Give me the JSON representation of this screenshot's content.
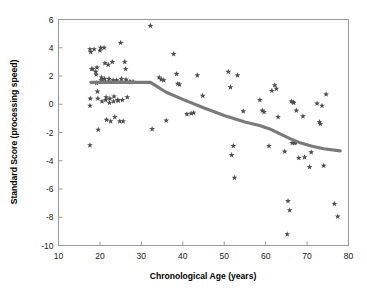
{
  "chart_data": {
    "type": "scatter",
    "title": "",
    "xlabel": "Chronological Age (years)",
    "ylabel": "Standard Score (processing speed)",
    "xlim": [
      10,
      80
    ],
    "ylim": [
      -10,
      6
    ],
    "xticks": [
      10,
      20,
      30,
      40,
      50,
      60,
      70,
      80
    ],
    "yticks": [
      6,
      4,
      2,
      0,
      -2,
      -4,
      -6,
      -8,
      -10
    ],
    "xtick_labels": [
      "10",
      "20",
      "30",
      "40",
      "50",
      "60",
      "70",
      "80"
    ],
    "ytick_labels": [
      "6",
      "4",
      "2",
      "0",
      "-2",
      "-4",
      "-6",
      "-8",
      "-10"
    ],
    "grid": false,
    "legend": false,
    "marker_style": "star",
    "marker_color": "#4d4d4d",
    "trend_line_color": "#7a7a7a",
    "frame_color": "#9a9a9a",
    "background_color": "#ffffff",
    "series": [
      {
        "name": "participants",
        "marker": "star",
        "points": [
          [
            17.6,
            3.9
          ],
          [
            17.8,
            3.7
          ],
          [
            18.0,
            2.5
          ],
          [
            18.3,
            2.5
          ],
          [
            17.7,
            0.4
          ],
          [
            17.6,
            -0.1
          ],
          [
            17.6,
            -2.9
          ],
          [
            18.6,
            3.9
          ],
          [
            19.0,
            2.3
          ],
          [
            19.1,
            2.1
          ],
          [
            19.3,
            2.6
          ],
          [
            19.2,
            1.5
          ],
          [
            19.4,
            0.9
          ],
          [
            19.5,
            0.4
          ],
          [
            19.6,
            -1.8
          ],
          [
            20.0,
            3.8
          ],
          [
            20.2,
            4.0
          ],
          [
            20.4,
            1.9
          ],
          [
            20.3,
            1.7
          ],
          [
            20.6,
            1.6
          ],
          [
            20.5,
            0.2
          ],
          [
            21.0,
            4.0
          ],
          [
            21.2,
            2.9
          ],
          [
            21.1,
            1.8
          ],
          [
            21.3,
            1.6
          ],
          [
            21.5,
            0.5
          ],
          [
            21.4,
            0.3
          ],
          [
            21.6,
            -1.1
          ],
          [
            22.0,
            2.8
          ],
          [
            22.2,
            1.8
          ],
          [
            22.1,
            1.6
          ],
          [
            22.4,
            0.4
          ],
          [
            22.3,
            0.1
          ],
          [
            22.6,
            -1.2
          ],
          [
            23.0,
            3.0
          ],
          [
            23.2,
            1.7
          ],
          [
            23.1,
            1.6
          ],
          [
            23.4,
            0.55
          ],
          [
            23.3,
            0.2
          ],
          [
            23.6,
            -0.9
          ],
          [
            24.0,
            1.7
          ],
          [
            24.2,
            1.6
          ],
          [
            24.3,
            0.3
          ],
          [
            24.4,
            0.25
          ],
          [
            24.8,
            -1.2
          ],
          [
            25.0,
            4.35
          ],
          [
            25.2,
            1.8
          ],
          [
            25.1,
            1.6
          ],
          [
            25.4,
            0.3
          ],
          [
            25.6,
            -1.2
          ],
          [
            26.0,
            3.0
          ],
          [
            26.2,
            2.5
          ],
          [
            26.3,
            1.75
          ],
          [
            26.5,
            1.6
          ],
          [
            26.6,
            0.5
          ],
          [
            27.2,
            1.6
          ],
          [
            27.4,
            1.55
          ],
          [
            28.0,
            1.6
          ],
          [
            32.2,
            5.55
          ],
          [
            32.6,
            -1.75
          ],
          [
            34.3,
            1.9
          ],
          [
            34.8,
            1.75
          ],
          [
            35.4,
            1.7
          ],
          [
            36.0,
            -1.15
          ],
          [
            37.8,
            3.55
          ],
          [
            38.5,
            2.15
          ],
          [
            38.8,
            1.45
          ],
          [
            39.2,
            1.4
          ],
          [
            41.0,
            -0.7
          ],
          [
            42.0,
            -0.65
          ],
          [
            42.6,
            -0.6
          ],
          [
            43.5,
            2.05
          ],
          [
            44.8,
            0.6
          ],
          [
            51.0,
            2.3
          ],
          [
            51.5,
            1.2
          ],
          [
            51.8,
            -3.6
          ],
          [
            52.2,
            -2.95
          ],
          [
            52.5,
            -5.2
          ],
          [
            53.2,
            2.05
          ],
          [
            54.6,
            -0.5
          ],
          [
            58.6,
            0.3
          ],
          [
            59.2,
            -0.45
          ],
          [
            59.6,
            -0.55
          ],
          [
            60.8,
            -2.95
          ],
          [
            61.5,
            0.95
          ],
          [
            62.2,
            1.35
          ],
          [
            62.6,
            1.1
          ],
          [
            63.0,
            -0.9
          ],
          [
            64.6,
            -3.35
          ],
          [
            65.2,
            -9.2
          ],
          [
            65.4,
            -6.85
          ],
          [
            65.8,
            -7.5
          ],
          [
            66.2,
            0.2
          ],
          [
            66.6,
            0.15
          ],
          [
            66.8,
            0.1
          ],
          [
            66.4,
            -2.75
          ],
          [
            67.0,
            -2.75
          ],
          [
            67.2,
            -2.7
          ],
          [
            67.4,
            -0.45
          ],
          [
            68.0,
            -3.8
          ],
          [
            69.0,
            -0.85
          ],
          [
            69.4,
            -3.75
          ],
          [
            70.6,
            -4.45
          ],
          [
            71.0,
            -3.4
          ],
          [
            72.4,
            0.05
          ],
          [
            73.0,
            -1.25
          ],
          [
            73.2,
            -1.4
          ],
          [
            73.6,
            -0.1
          ],
          [
            74.0,
            -4.35
          ],
          [
            74.6,
            0.7
          ],
          [
            76.6,
            -7.05
          ],
          [
            77.4,
            -7.95
          ]
        ]
      }
    ],
    "trend_line": {
      "name": "fitted trend",
      "points": [
        [
          17.8,
          1.55
        ],
        [
          24.0,
          1.55
        ],
        [
          32.2,
          1.55
        ],
        [
          36.0,
          0.85
        ],
        [
          40.0,
          0.35
        ],
        [
          45.0,
          -0.25
        ],
        [
          50.0,
          -0.8
        ],
        [
          55.0,
          -1.25
        ],
        [
          58.5,
          -1.5
        ],
        [
          61.0,
          -1.75
        ],
        [
          63.5,
          -2.1
        ],
        [
          66.0,
          -2.45
        ],
        [
          68.5,
          -2.75
        ],
        [
          71.0,
          -2.95
        ],
        [
          74.0,
          -3.15
        ],
        [
          78.0,
          -3.3
        ]
      ]
    }
  }
}
